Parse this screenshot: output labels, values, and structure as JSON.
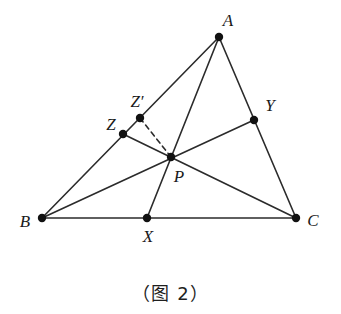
{
  "figure": {
    "caption": "（图 2）",
    "caption_position": {
      "x": 170,
      "y": 279
    },
    "stroke_color": "#2b2b2b",
    "dash_color": "#2b2b2b",
    "point_color": "#111111",
    "label_color": "#1a1a1a",
    "background": "#ffffff",
    "stroke_width": 1.6,
    "point_radius": 4.2,
    "width": 341,
    "height": 314
  },
  "points": [
    {
      "id": "A",
      "name": "vertex-a",
      "label": "A",
      "x": 219,
      "y": 37,
      "label_x": 228,
      "label_y": 20
    },
    {
      "id": "B",
      "name": "vertex-b",
      "label": "B",
      "x": 42,
      "y": 218,
      "label_x": 25,
      "label_y": 221
    },
    {
      "id": "C",
      "name": "vertex-c",
      "label": "C",
      "x": 296,
      "y": 218,
      "label_x": 313,
      "label_y": 220
    },
    {
      "id": "X",
      "name": "point-x",
      "label": "X",
      "x": 147,
      "y": 218,
      "label_x": 148,
      "label_y": 236
    },
    {
      "id": "Y",
      "name": "point-y",
      "label": "Y",
      "x": 254,
      "y": 120,
      "label_x": 270,
      "label_y": 105
    },
    {
      "id": "Z",
      "name": "point-z",
      "label": "Z",
      "x": 123,
      "y": 134,
      "label_x": 111,
      "label_y": 124
    },
    {
      "id": "Zp",
      "name": "point-z-prime",
      "label": "Z′",
      "x": 140,
      "y": 118,
      "label_x": 137,
      "label_y": 101
    },
    {
      "id": "P",
      "name": "point-p",
      "label": "P",
      "x": 171,
      "y": 157,
      "label_x": 179,
      "label_y": 176
    }
  ],
  "segments": [
    {
      "name": "segment-b-a",
      "from": "B",
      "to": "A",
      "style": "solid"
    },
    {
      "name": "segment-b-c",
      "from": "B",
      "to": "C",
      "style": "solid"
    },
    {
      "name": "segment-a-c",
      "from": "A",
      "to": "C",
      "style": "solid"
    },
    {
      "name": "cevian-a-x",
      "from": "A",
      "to": "X",
      "style": "solid"
    },
    {
      "name": "cevian-b-y",
      "from": "B",
      "to": "Y",
      "style": "solid"
    },
    {
      "name": "cevian-c-z",
      "from": "C",
      "to": "Z",
      "style": "solid"
    },
    {
      "name": "segment-z-prime-p",
      "from": "Zp",
      "to": "P",
      "style": "dashed"
    }
  ],
  "chart_data": {
    "type": "diagram",
    "title": "（图 2）",
    "vertices": {
      "A": [
        219,
        37
      ],
      "B": [
        42,
        218
      ],
      "C": [
        296,
        218
      ],
      "X": [
        147,
        218
      ],
      "Y": [
        254,
        120
      ],
      "Z": [
        123,
        134
      ],
      "Z_prime": [
        140,
        118
      ],
      "P": [
        171,
        157
      ]
    },
    "edges": [
      [
        "B",
        "A"
      ],
      [
        "B",
        "C"
      ],
      [
        "A",
        "C"
      ],
      [
        "A",
        "X"
      ],
      [
        "B",
        "Y"
      ],
      [
        "C",
        "Z"
      ]
    ],
    "dashed_edges": [
      [
        "Z_prime",
        "P"
      ]
    ],
    "concurrency_point": "P",
    "points_on_sides": {
      "X": "on BC",
      "Y": "on AC",
      "Z": "on AB",
      "Z_prime": "on AB"
    }
  }
}
